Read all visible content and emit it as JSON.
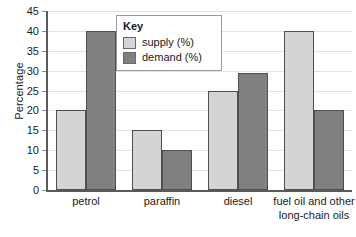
{
  "chart_data": {
    "type": "bar",
    "title": "",
    "xlabel": "",
    "ylabel": "Percentage",
    "ylim": [
      0,
      45
    ],
    "ytick_step": 5,
    "yticks": [
      0,
      5,
      10,
      15,
      20,
      25,
      30,
      35,
      40,
      45
    ],
    "ytick_labels": [
      "0",
      "5",
      "10",
      "15",
      "20",
      "25",
      "30",
      "35",
      "40",
      "45"
    ],
    "grid": true,
    "legend_position": "top-center",
    "legend_title": "Key",
    "categories": [
      "petrol",
      "paraffin",
      "diesel",
      "fuel oil and other long-chain oils"
    ],
    "category_label_lines": [
      [
        "petrol"
      ],
      [
        "paraffin"
      ],
      [
        "diesel"
      ],
      [
        "fuel oil and other",
        "long-chain oils"
      ]
    ],
    "series": [
      {
        "name": "supply (%)",
        "color": "#d4d4d4",
        "values": [
          20,
          15,
          25,
          40
        ]
      },
      {
        "name": "demand (%)",
        "color": "#808080",
        "values": [
          40,
          10,
          29.5,
          20
        ]
      }
    ]
  },
  "colors": {
    "supply": "#d4d4d4",
    "demand": "#808080",
    "bar_outline": "#4f4f4f",
    "axis": "#5a5a5a",
    "gridline": "#e2e2e2",
    "background": "#ffffff",
    "text": "#1a1a1a"
  }
}
